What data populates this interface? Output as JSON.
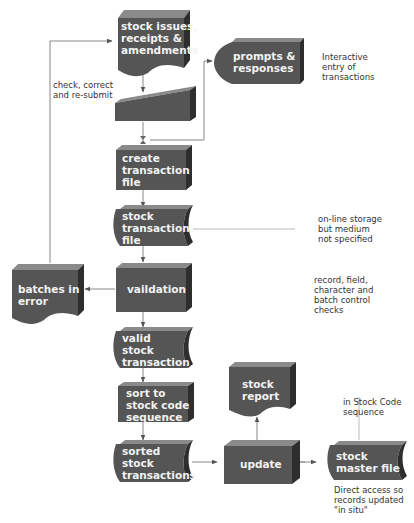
{
  "diagram": {
    "type": "system flowchart",
    "colors": {
      "shape_fill": "#555555",
      "shape_top": "#8a8a8a",
      "shape_side": "#2e2e2e",
      "connector": "#777777",
      "label_text": "#f2f2f2",
      "note_text": "#333333"
    },
    "nodes": {
      "input_doc": {
        "label": "stock issues,\nreceipts &\namendments",
        "shape": "document"
      },
      "manual_input": {
        "label": "",
        "shape": "manual-input"
      },
      "prompts": {
        "label": "prompts &\nresponses",
        "shape": "display"
      },
      "create_file": {
        "label": "create\ntransaction\nfile",
        "shape": "process"
      },
      "stock_txn_file": {
        "label": "stock\ntransaction\nfile",
        "shape": "online-storage"
      },
      "validation": {
        "label": "vaildation",
        "shape": "process"
      },
      "batches_error": {
        "label": "batches in\nerror",
        "shape": "document"
      },
      "valid_txn": {
        "label": "valid\nstock\ntransaction",
        "shape": "online-storage"
      },
      "sort": {
        "label": "sort to\nstock code\nsequence",
        "shape": "process"
      },
      "sorted_txn": {
        "label": "sorted\nstock\ntransactions",
        "shape": "online-storage"
      },
      "update": {
        "label": "update",
        "shape": "process"
      },
      "stock_report": {
        "label": "stock\nreport",
        "shape": "document"
      },
      "master_file": {
        "label": "stock\nmaster file",
        "shape": "online-storage"
      }
    },
    "notes": {
      "check_correct": "check, correct\nand re-submit",
      "interactive": "Interactive\nentry of\ntransactions",
      "online_storage": "on-line storage\nbut medium\nnot specified",
      "checks": "record, field,\ncharacter and\nbatch control\nchecks",
      "stock_code_seq": "in Stock Code\nsequence",
      "direct_access": "Direct access so\nrecords updated\n\"in situ\""
    }
  }
}
